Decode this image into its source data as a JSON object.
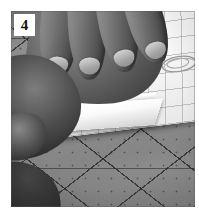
{
  "figure": {
    "step_number": "4",
    "caption": "",
    "alt_description": "Two hands cutting a sheet of grid paper with a craft knife on a self-healing cutting mat",
    "color_mode": "grayscale",
    "scene": {
      "background_surface": "self-healing cutting mat",
      "mat_color": "#8d8d8d",
      "mat_line_color": "#1e1e1e",
      "paper_label": "grid paper sheet",
      "paper_color": "#f3f2ee",
      "paper_grid_color": "#787d82",
      "tool_label": "craft knife blade",
      "tool_color": "#c9c9c9",
      "sketch_label": "pencil sketch on grid paper",
      "sketch_color": "#8f8f8f",
      "hand_upper_label": "upper hand holding paper flat",
      "hand_lower_label": "lower hand gripping the knife",
      "skin_tone": "#5e5e5e",
      "cut_strip_label": "cut paper strip being lifted"
    },
    "label_box": {
      "background": "#ffffff",
      "text_color": "#101010"
    },
    "page_background": "#ffffff"
  }
}
